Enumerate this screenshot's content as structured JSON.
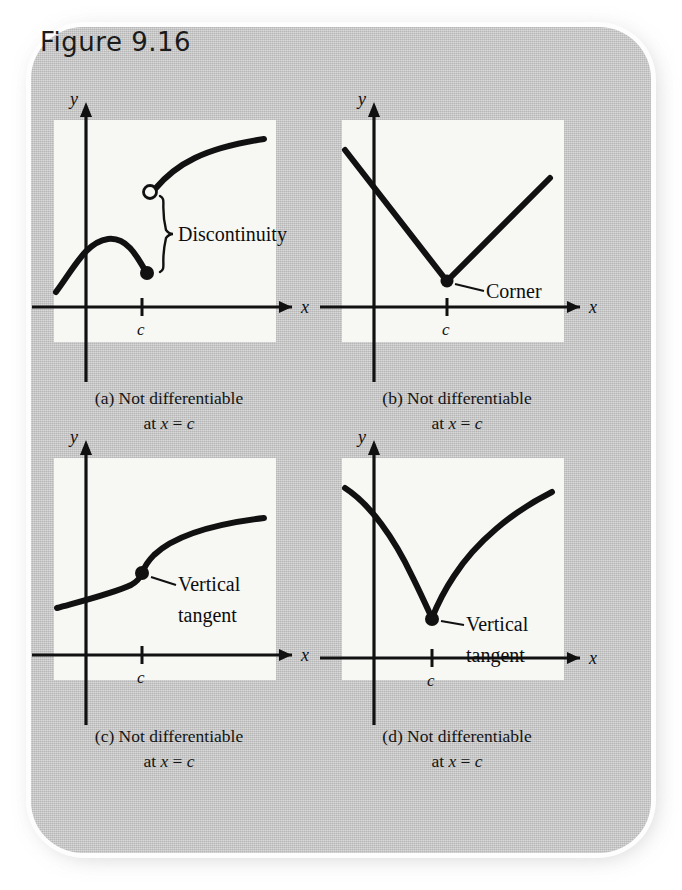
{
  "figure": {
    "title": "Figure 9.16",
    "background_color": "#c9c9c9",
    "panel_background_color": "#f7f7f4",
    "ink_color": "#111111"
  },
  "panels": [
    {
      "id": "a",
      "caption_line1": "(a) Not differentiable",
      "caption_line2_prefix": "at ",
      "caption_x": "x",
      "caption_eq": " = ",
      "caption_c": "c",
      "y_axis_label": "y",
      "x_axis_label": "x",
      "tick_label": "c",
      "annotation": "Discontinuity",
      "description": "jump discontinuity: left branch ends in a solid dot below, right branch begins at an open circle above",
      "marker_left": "filled-dot",
      "marker_right": "open-circle",
      "has_brace": true
    },
    {
      "id": "b",
      "caption_line1": "(b) Not differentiable",
      "caption_line2_prefix": "at ",
      "caption_x": "x",
      "caption_eq": " = ",
      "caption_c": "c",
      "y_axis_label": "y",
      "x_axis_label": "x",
      "tick_label": "c",
      "annotation": "Corner",
      "description": "absolute-value style V shape with a sharp corner vertex at x = c",
      "marker_left": "filled-dot",
      "marker_right": "",
      "has_brace": false
    },
    {
      "id": "c",
      "caption_line1": "(c) Not differentiable",
      "caption_line2_prefix": "at ",
      "caption_x": "x",
      "caption_eq": " = ",
      "caption_c": "c",
      "y_axis_label": "y",
      "x_axis_label": "x",
      "tick_label": "c",
      "annotation_line1": "Vertical",
      "annotation_line2": "tangent",
      "description": "cube-root style S curve with an infinitely steep inflection point at x = c",
      "marker_left": "filled-dot",
      "marker_right": "",
      "has_brace": false
    },
    {
      "id": "d",
      "caption_line1": "(d) Not differentiable",
      "caption_line2_prefix": "at ",
      "caption_x": "x",
      "caption_eq": " = ",
      "caption_c": "c",
      "y_axis_label": "y",
      "x_axis_label": "x",
      "tick_label": "c",
      "annotation_line1": "Vertical",
      "annotation_line2": "tangent",
      "description": "cusp shape with vertical tangent at the bottom point x = c",
      "marker_left": "filled-dot",
      "marker_right": "",
      "has_brace": false
    }
  ]
}
